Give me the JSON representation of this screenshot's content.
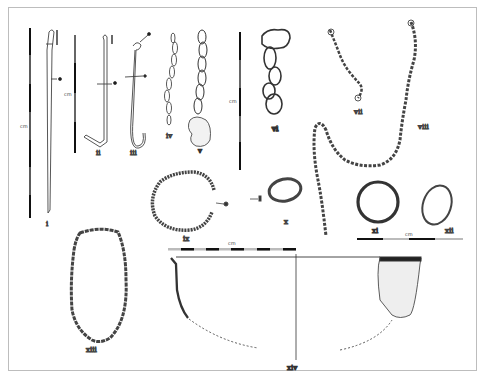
{
  "figure": {
    "frame_color": "#bdbdbd",
    "ink_color": "#3a3a3a",
    "objects": [
      {
        "id": "i",
        "label": "i",
        "type": "pin"
      },
      {
        "id": "ii",
        "label": "ii",
        "type": "hook"
      },
      {
        "id": "iii",
        "label": "iii",
        "type": "hook"
      },
      {
        "id": "iv",
        "label": "iv",
        "type": "chain"
      },
      {
        "id": "v",
        "label": "v",
        "type": "chain with fragment"
      },
      {
        "id": "vi",
        "label": "vi",
        "type": "chain links"
      },
      {
        "id": "vii",
        "label": "vii",
        "type": "chain"
      },
      {
        "id": "viii",
        "label": "viii",
        "type": "chain"
      },
      {
        "id": "ix",
        "label": "ix",
        "type": "ring"
      },
      {
        "id": "x",
        "label": "x",
        "type": "ring"
      },
      {
        "id": "xi",
        "label": "xi",
        "type": "ring"
      },
      {
        "id": "xii",
        "label": "xii",
        "type": "ring"
      },
      {
        "id": "xiii",
        "label": "xiii",
        "type": "loop"
      },
      {
        "id": "xiv",
        "label": "xiv",
        "type": "vessel profile"
      }
    ],
    "scales": [
      {
        "id": "scale-1",
        "label": "cm",
        "orientation": "vertical"
      },
      {
        "id": "scale-2",
        "label": "cm",
        "orientation": "vertical"
      },
      {
        "id": "scale-3",
        "label": "cm",
        "orientation": "vertical"
      },
      {
        "id": "scale-4",
        "label": "cm",
        "orientation": "horizontal"
      },
      {
        "id": "scale-5",
        "label": "cm",
        "orientation": "horizontal"
      }
    ]
  }
}
